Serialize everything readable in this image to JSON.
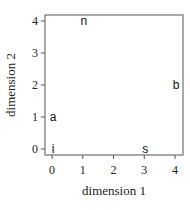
{
  "chart_data": {
    "type": "scatter",
    "title": "",
    "xlabel": "dimension 1",
    "ylabel": "dimension 2",
    "xlim": [
      0,
      4
    ],
    "ylim": [
      0,
      4
    ],
    "xticks": [
      "0",
      "1",
      "2",
      "3",
      "4"
    ],
    "yticks": [
      "0",
      "1",
      "2",
      "3",
      "4"
    ],
    "grid": false,
    "points": [
      {
        "label": "n",
        "x": 1,
        "y": 4
      },
      {
        "label": "b",
        "x": 4,
        "y": 2
      },
      {
        "label": "a",
        "x": 0,
        "y": 1
      },
      {
        "label": "i",
        "x": 0,
        "y": 0
      },
      {
        "label": "s",
        "x": 3,
        "y": 0
      }
    ]
  }
}
